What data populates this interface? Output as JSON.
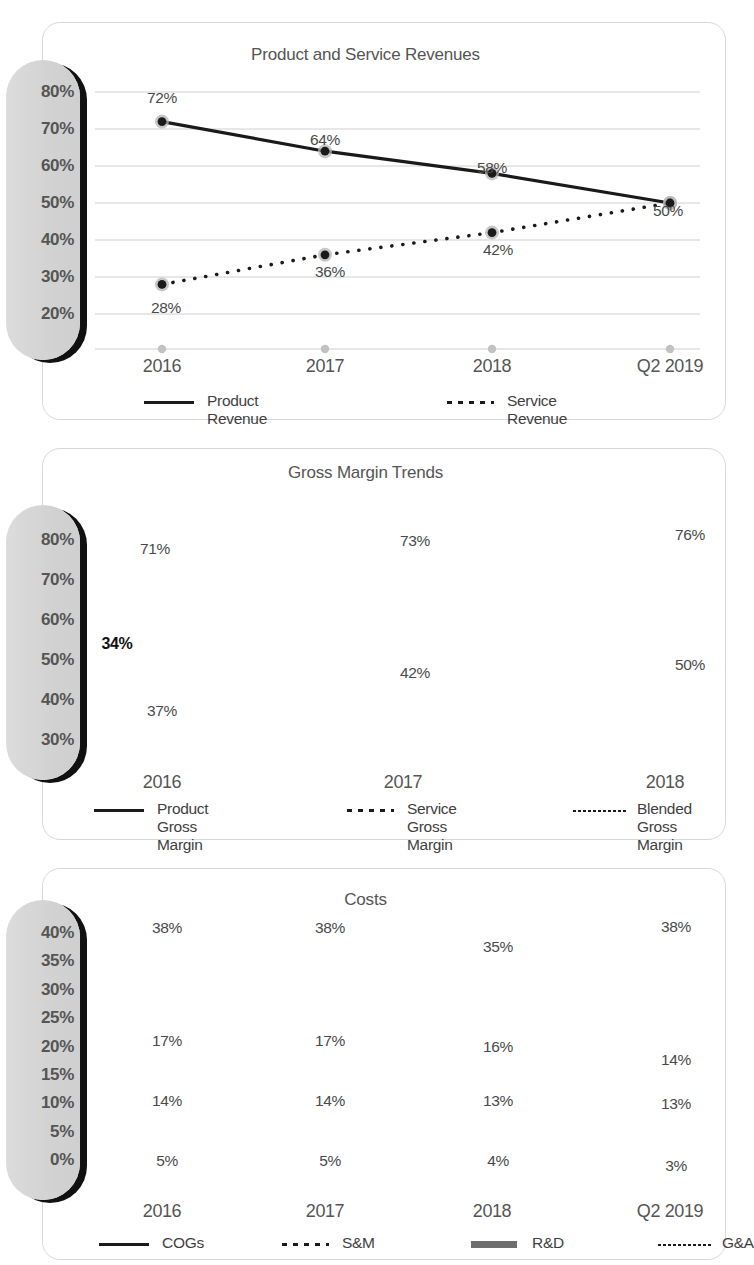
{
  "charts": [
    {
      "id": "revenues",
      "title": "Product and Service Revenues",
      "ytick_labels": [
        "80%",
        "70%",
        "60%",
        "50%",
        "40%",
        "30%",
        "20%"
      ],
      "xtick_labels": [
        "2016",
        "2017",
        "2018",
        "Q2 2019"
      ],
      "legend": [
        {
          "label": "Product Revenue",
          "style": "solid"
        },
        {
          "label": "Service Revenue",
          "style": "dots"
        }
      ],
      "chart_data": {
        "type": "line",
        "title": "Product and Service Revenues",
        "xlabel": "",
        "ylabel": "",
        "categories": [
          "2016",
          "2017",
          "2018",
          "Q2 2019"
        ],
        "ylim": [
          20,
          80
        ],
        "yticks": [
          20,
          30,
          40,
          50,
          60,
          70,
          80
        ],
        "grid": true,
        "legend_position": "bottom",
        "series": [
          {
            "name": "Product Revenue",
            "style": "solid",
            "values": [
              72,
              64,
              58,
              50
            ],
            "labels": [
              "72%",
              "64%",
              "58%",
              "50%"
            ]
          },
          {
            "name": "Service Revenue",
            "style": "dots",
            "values": [
              28,
              36,
              42,
              50
            ],
            "labels": [
              "28%",
              "36%",
              "42%",
              ""
            ]
          }
        ]
      }
    },
    {
      "id": "gross-margin",
      "title": "Gross Margin Trends",
      "ytick_labels": [
        "80%",
        "70%",
        "60%",
        "50%",
        "40%",
        "30%"
      ],
      "xtick_labels": [
        "2016",
        "2017",
        "2018"
      ],
      "annotation": {
        "label": "34%",
        "from": 71,
        "to": 37
      },
      "legend": [
        {
          "label": "Product\nGross Margin",
          "style": "solid"
        },
        {
          "label": "Service\nGross Margin",
          "style": "dots"
        },
        {
          "label": "Blended\nGross Margin",
          "style": "fine"
        }
      ],
      "chart_data": {
        "type": "line",
        "title": "Gross Margin Trends",
        "xlabel": "",
        "ylabel": "",
        "categories": [
          "2016",
          "2017",
          "2018"
        ],
        "ylim": [
          30,
          80
        ],
        "yticks": [
          30,
          40,
          50,
          60,
          70,
          80
        ],
        "grid": true,
        "legend_position": "bottom",
        "annotations": [
          {
            "text": "34%",
            "type": "double-arrow",
            "from": 71,
            "to": 37,
            "at_x": "2016"
          }
        ],
        "series": [
          {
            "name": "Product Gross Margin",
            "style": "solid",
            "values": [
              71,
              73,
              76
            ],
            "labels": [
              "71%",
              "73%",
              "76%"
            ]
          },
          {
            "name": "Service Gross Margin",
            "style": "dots",
            "values": [
              62,
              60,
              65
            ],
            "labels": [
              "",
              "",
              ""
            ]
          },
          {
            "name": "Blended Gross Margin",
            "style": "fine",
            "values": [
              37,
              42,
              50
            ],
            "labels": [
              "37%",
              "42%",
              "50%"
            ]
          }
        ]
      }
    },
    {
      "id": "costs",
      "title": "Costs",
      "ytick_labels": [
        "40%",
        "35%",
        "30%",
        "25%",
        "20%",
        "15%",
        "10%",
        "5%",
        "0%"
      ],
      "xtick_labels": [
        "2016",
        "2017",
        "2018",
        "Q2 2019"
      ],
      "legend": [
        {
          "label": "COGs",
          "style": "solid"
        },
        {
          "label": "S&M",
          "style": "dots"
        },
        {
          "label": "R&D",
          "style": "thick"
        },
        {
          "label": "G&A",
          "style": "fine"
        }
      ],
      "chart_data": {
        "type": "line",
        "title": "Costs",
        "xlabel": "",
        "ylabel": "",
        "categories": [
          "2016",
          "2017",
          "2018",
          "Q2 2019"
        ],
        "ylim": [
          0,
          40
        ],
        "yticks": [
          0,
          5,
          10,
          15,
          20,
          25,
          30,
          35,
          40
        ],
        "grid": true,
        "legend_position": "bottom",
        "series": [
          {
            "name": "COGs",
            "style": "solid",
            "values": [
              38,
              38,
              35,
              38
            ],
            "labels": [
              "38%",
              "38%",
              "35%",
              "38%"
            ]
          },
          {
            "name": "S&M",
            "style": "dots",
            "values": [
              17,
              17,
              16,
              14
            ],
            "labels": [
              "17%",
              "17%",
              "16%",
              "14%"
            ]
          },
          {
            "name": "R&D",
            "style": "thick",
            "values": [
              14,
              14,
              13,
              13
            ],
            "labels": [
              "14%",
              "14%",
              "13%",
              "13%"
            ]
          },
          {
            "name": "G&A",
            "style": "fine",
            "values": [
              5,
              5,
              4,
              3
            ],
            "labels": [
              "5%",
              "5%",
              "4%",
              "3%"
            ]
          }
        ]
      }
    }
  ],
  "colors": {
    "line": "#1a1a1a",
    "thick_line": "#6e6e6e",
    "grid": "#cfcfcf",
    "marker_fill": "#1a1a1a",
    "marker_halo": "#b5b5b5",
    "axis_pill": "#d6d6d6",
    "text": "#4a4a4a"
  }
}
